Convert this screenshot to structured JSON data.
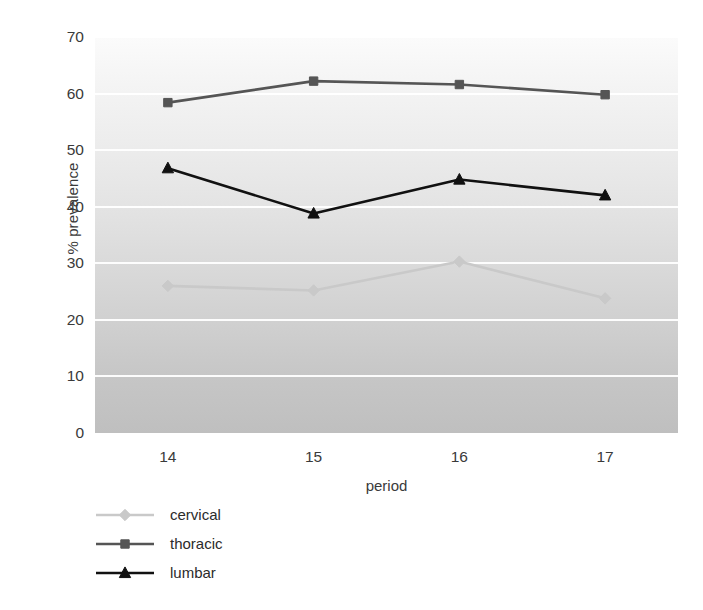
{
  "chart_data": {
    "type": "line",
    "title": "",
    "xlabel": "period",
    "ylabel": "% prevalence",
    "categories": [
      "14",
      "15",
      "16",
      "17"
    ],
    "x": [
      14,
      15,
      16,
      17
    ],
    "xlim": [
      13.5,
      17.5
    ],
    "ylim": [
      0,
      70
    ],
    "ytick_labels": [
      "0",
      "10",
      "20",
      "30",
      "40",
      "50",
      "60",
      "70"
    ],
    "yticks": [
      0,
      10,
      20,
      30,
      40,
      50,
      60,
      70
    ],
    "grid": "horizontal-white",
    "legend_position": "below-left",
    "series": [
      {
        "name": "cervical",
        "marker": "diamond",
        "color": "#c9c9c9",
        "values": [
          26.0,
          25.2,
          30.3,
          23.8
        ]
      },
      {
        "name": "thoracic",
        "marker": "square",
        "color": "#555555",
        "values": [
          58.4,
          62.2,
          61.6,
          59.8
        ]
      },
      {
        "name": "lumbar",
        "marker": "triangle",
        "color": "#111111",
        "values": [
          46.8,
          38.8,
          44.8,
          42.0
        ]
      }
    ]
  },
  "legend": {
    "items": [
      {
        "label": "cervical"
      },
      {
        "label": "thoracic"
      },
      {
        "label": "lumbar"
      }
    ]
  },
  "colors": {
    "cervical": "#c9c9c9",
    "thoracic": "#555555",
    "lumbar": "#111111",
    "gridline": "#ffffff",
    "plot_background_top": "#fbfbfb",
    "plot_background_bottom": "#bfbfbf",
    "text": "#3a3a3a"
  }
}
